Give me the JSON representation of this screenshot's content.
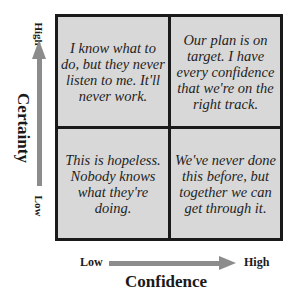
{
  "quadrants": {
    "top_left": "I know what to do, but they never listen to me. It'll never work.",
    "top_right": "Our plan is on target. I have every confidence that we're on the right track.",
    "bottom_left": "This is hopeless. Nobody knows what they're doing.",
    "bottom_right": "We've never done this before, but together we can get through it."
  },
  "y_axis": {
    "title": "Certainty",
    "high_label": "High",
    "low_label": "Low"
  },
  "x_axis": {
    "title": "Confidence",
    "low_label": "Low",
    "high_label": "High"
  },
  "colors": {
    "quadrant_fill": "#d8d8d8",
    "border": "#1a1a1a",
    "arrow": "#8c8c8c"
  }
}
